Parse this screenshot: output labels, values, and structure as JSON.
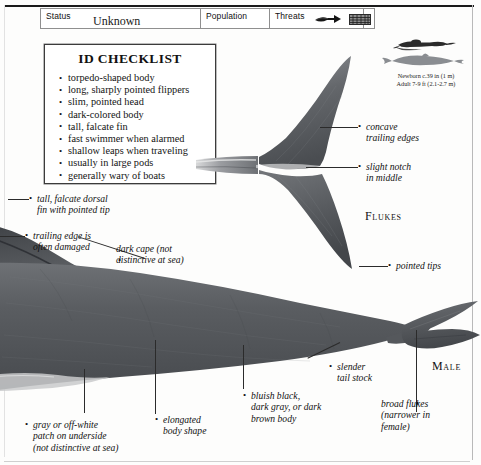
{
  "header": {
    "fields": [
      {
        "label": "Status",
        "value": "Unknown",
        "name": "status"
      },
      {
        "label": "Population",
        "value": "Unknown",
        "name": "population"
      },
      {
        "label": "Threats",
        "value": "",
        "name": "threats"
      }
    ],
    "threat_icons": [
      "harpoon-icon",
      "drift-net-icon"
    ]
  },
  "checklist": {
    "title": "ID CHECKLIST",
    "items": [
      "torpedo-shaped body",
      "long, sharply pointed flippers",
      "slim, pointed head",
      "dark-colored body",
      "tall, falcate fin",
      "fast swimmer when alarmed",
      "shallow leaps when traveling",
      "usually in large pods",
      "generally wary of boats"
    ]
  },
  "size": {
    "newborn": "Newborn c.39 in (1 m)",
    "adult": "Adult 7-9 ft (2.1-2.7 m)"
  },
  "labels": {
    "flukes": "Flukes",
    "male": "Male"
  },
  "annotations": [
    {
      "name": "concave-trailing-edges",
      "text": "concave\ntrailing edges"
    },
    {
      "name": "slight-notch-in-middle",
      "text": "slight notch\nin middle"
    },
    {
      "name": "pointed-tips",
      "text": "pointed tips"
    },
    {
      "name": "tall-falcate-dorsal-fin",
      "text": "tall, falcate dorsal\nfin with pointed tip"
    },
    {
      "name": "trailing-edge-damaged",
      "text": "trailing edge is\noften damaged"
    },
    {
      "name": "dark-cape",
      "text": "dark cape (not\ndistinctive at sea)"
    },
    {
      "name": "gray-patch-underside",
      "text": "gray or off-white\npatch on underside\n(not distinctive at sea)"
    },
    {
      "name": "elongated-body-shape",
      "text": "elongated\nbody shape"
    },
    {
      "name": "bluish-black-body",
      "text": "bluish black,\ndark gray, or dark\nbrown body"
    },
    {
      "name": "slender-tail-stock",
      "text": "slender\ntail stock"
    },
    {
      "name": "broad-flukes",
      "text": "broad flukes\n(narrower in\nfemale)"
    }
  ],
  "colors": {
    "body_dark": "#4e5054",
    "body_mid": "#676a6e",
    "ink": "#111111",
    "page": "#fdfdfc"
  }
}
